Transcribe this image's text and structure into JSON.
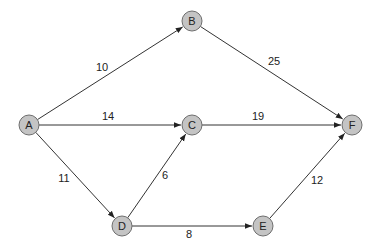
{
  "graph": {
    "directed": true,
    "node_fill": "#c4c4c4",
    "node_stroke": "#6e6e6e",
    "edge_color": "#333333",
    "nodes": [
      {
        "id": "A",
        "label": "A",
        "x": 29,
        "y": 125
      },
      {
        "id": "B",
        "label": "B",
        "x": 192,
        "y": 21
      },
      {
        "id": "C",
        "label": "C",
        "x": 192,
        "y": 125
      },
      {
        "id": "D",
        "label": "D",
        "x": 122,
        "y": 226
      },
      {
        "id": "E",
        "label": "E",
        "x": 263,
        "y": 226
      },
      {
        "id": "F",
        "label": "F",
        "x": 352,
        "y": 125
      }
    ],
    "edges": [
      {
        "from": "A",
        "to": "B",
        "weight": "10",
        "lx": 102,
        "ly": 71
      },
      {
        "from": "A",
        "to": "C",
        "weight": "14",
        "lx": 108,
        "ly": 120
      },
      {
        "from": "A",
        "to": "D",
        "weight": "11",
        "lx": 64,
        "ly": 182
      },
      {
        "from": "B",
        "to": "F",
        "weight": "25",
        "lx": 274,
        "ly": 65
      },
      {
        "from": "C",
        "to": "F",
        "weight": "19",
        "lx": 258,
        "ly": 120
      },
      {
        "from": "D",
        "to": "C",
        "weight": "6",
        "lx": 165,
        "ly": 179
      },
      {
        "from": "D",
        "to": "E",
        "weight": "8",
        "lx": 189,
        "ly": 238
      },
      {
        "from": "E",
        "to": "F",
        "weight": "12",
        "lx": 317,
        "ly": 184
      }
    ]
  }
}
